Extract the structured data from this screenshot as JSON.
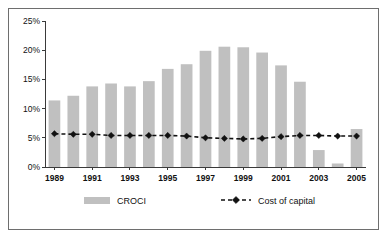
{
  "chart_data": {
    "type": "bar",
    "title": "",
    "subtitle": "",
    "xlabel": "",
    "ylabel": "",
    "ylim": [
      0,
      25
    ],
    "ytick_values": [
      0,
      5,
      10,
      15,
      20,
      25
    ],
    "ytick_labels": [
      "0%",
      "5%",
      "10%",
      "15%",
      "20%",
      "25%"
    ],
    "grid": false,
    "legend_position": "bottom",
    "categories": [
      "1989",
      "1990",
      "1991",
      "1992",
      "1993",
      "1994",
      "1995",
      "1996",
      "1997",
      "1998",
      "1999",
      "2000",
      "2001",
      "2002",
      "2003",
      "2004",
      "2005"
    ],
    "xtick_labels": [
      "1989",
      "1991",
      "1993",
      "1995",
      "1997",
      "1999",
      "2001",
      "2003",
      "2005"
    ],
    "series": [
      {
        "name": "CROCI",
        "type": "bar",
        "color": "#c0c0c0",
        "values": [
          11.4,
          12.2,
          13.8,
          14.3,
          13.8,
          14.7,
          16.8,
          17.6,
          19.9,
          20.6,
          20.5,
          19.6,
          17.4,
          14.6,
          2.9,
          0.6,
          6.5
        ]
      },
      {
        "name": "Cost of capital",
        "type": "line",
        "color": "#111111",
        "values": [
          5.7,
          5.6,
          5.6,
          5.4,
          5.4,
          5.4,
          5.4,
          5.3,
          5.0,
          4.9,
          4.8,
          4.9,
          5.2,
          5.4,
          5.4,
          5.3,
          5.3
        ]
      }
    ]
  },
  "legend": {
    "entries": [
      {
        "label": "CROCI",
        "marker": "bar-swatch"
      },
      {
        "label": "Cost of capital",
        "marker": "dashed-diamond"
      }
    ]
  },
  "colors": {
    "bar": "#c0c0c0",
    "line": "#111111",
    "axis": "#3a3a3a",
    "frame": "#6e6e6e",
    "background": "#ffffff"
  }
}
